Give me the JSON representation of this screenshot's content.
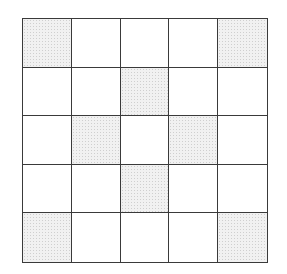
{
  "grid": {
    "rows": 5,
    "cols": 5,
    "shaded_color": "#f1f1f1",
    "line_color": "#3a3a3a",
    "shaded_cells": [
      [
        0,
        0
      ],
      [
        0,
        4
      ],
      [
        1,
        2
      ],
      [
        2,
        1
      ],
      [
        2,
        3
      ],
      [
        3,
        2
      ],
      [
        4,
        0
      ],
      [
        4,
        4
      ]
    ],
    "pattern": [
      [
        1,
        0,
        0,
        0,
        1
      ],
      [
        0,
        0,
        1,
        0,
        0
      ],
      [
        0,
        1,
        0,
        1,
        0
      ],
      [
        0,
        0,
        1,
        0,
        0
      ],
      [
        1,
        0,
        0,
        0,
        1
      ]
    ]
  }
}
